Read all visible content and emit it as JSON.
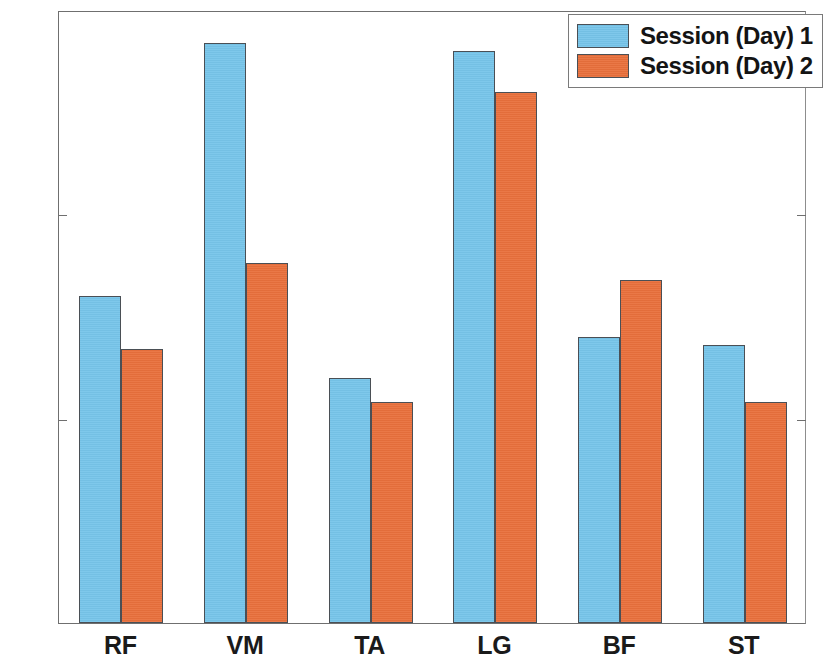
{
  "chart_data": {
    "type": "bar",
    "title": "",
    "subtitle": "",
    "xlabel": "",
    "ylabel": "",
    "categories": [
      "RF",
      "VM",
      "TA",
      "LG",
      "BF",
      "ST"
    ],
    "series": [
      {
        "name": "Session (Day) 1",
        "color": "#77c5ea",
        "values": [
          80,
          142,
          60,
          140,
          70,
          68
        ]
      },
      {
        "name": "Session (Day) 2",
        "color": "#e9703c",
        "values": [
          67,
          88,
          54,
          130,
          84,
          54
        ]
      }
    ],
    "ylim": [
      0,
      150
    ],
    "yticks": [
      0,
      50,
      100,
      150
    ],
    "ytick_labels": [
      "0",
      "50",
      "100",
      "150"
    ],
    "grid": false,
    "legend_position": "top-right",
    "annotations": []
  },
  "legend": {
    "entries": [
      {
        "label": "Session (Day) 1"
      },
      {
        "label": "Session (Day) 2"
      }
    ]
  },
  "axes": {
    "y_tick_labels": [
      "150",
      "100",
      "50",
      "0"
    ],
    "x_tick_labels": [
      "RF",
      "VM",
      "TA",
      "LG",
      "BF",
      "ST"
    ]
  }
}
